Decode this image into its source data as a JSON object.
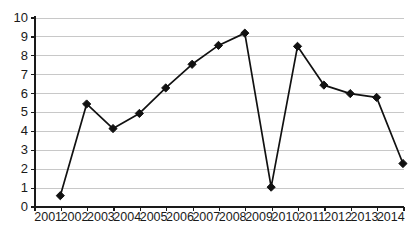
{
  "chart_data": {
    "type": "line",
    "title": "",
    "subtitle": "",
    "xlabel": "",
    "ylabel": "",
    "categories": [
      "2001",
      "2002",
      "2003",
      "2004",
      "2005",
      "2006",
      "2007",
      "2008",
      "2009",
      "2010",
      "2011",
      "2012",
      "2013",
      "2014"
    ],
    "values": [
      0.6,
      5.45,
      4.15,
      4.95,
      6.3,
      7.55,
      8.55,
      9.2,
      1.05,
      8.5,
      6.45,
      6.0,
      5.8,
      2.3
    ],
    "series": [
      {
        "name": "",
        "values": [
          0.6,
          5.45,
          4.15,
          4.95,
          6.3,
          7.55,
          8.55,
          9.2,
          1.05,
          8.5,
          6.45,
          6.0,
          5.8,
          2.3
        ]
      }
    ],
    "ylim": [
      0,
      10
    ],
    "y_ticks": [
      0,
      1,
      2,
      3,
      4,
      5,
      6,
      7,
      8,
      9,
      10
    ],
    "y_tick_labels": [
      "0",
      "1",
      "2",
      "3",
      "4",
      "5",
      "6",
      "7",
      "8",
      "9",
      "10"
    ],
    "x_tick_labels": [
      "2001",
      "2002",
      "2003",
      "2004",
      "2005",
      "2006",
      "2007",
      "2008",
      "2009",
      "2010",
      "2011",
      "2012",
      "2013",
      "2014"
    ],
    "grid": true,
    "grid_axis": "y",
    "legend": false,
    "legend_position": "none",
    "marker": "diamond",
    "marker_color": "#111111",
    "line_color": "#111111",
    "gridline_color": "#c8c8c8",
    "axis_color": "#1a1a1a",
    "background_color": "#ffffff",
    "annotations": []
  },
  "geometry": {
    "plot_left": 35,
    "plot_right": 404,
    "plot_top": 18,
    "plot_bottom": 207,
    "label_baseline_y": 212
  }
}
